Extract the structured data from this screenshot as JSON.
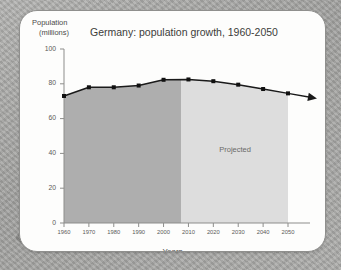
{
  "card": {
    "background_color": "#fdfdfc",
    "border_color": "#8f8f8d"
  },
  "page": {
    "backdrop_color": "#a9a9a7"
  },
  "chart_data": {
    "type": "area",
    "title": "Germany: population growth, 1960-2050",
    "xlabel": "Years",
    "ylabel": "Population (millions)",
    "ylabel_line1": "Population",
    "ylabel_line2": "(millions)",
    "categories": [
      1960,
      1970,
      1980,
      1990,
      2000,
      2010,
      2020,
      2030,
      2040,
      2050
    ],
    "values": [
      73,
      78,
      78,
      79,
      82.3,
      82.5,
      81.5,
      79.5,
      77,
      74.5
    ],
    "series": [
      {
        "name": "Germany population",
        "values": [
          73,
          78,
          78,
          79,
          82.3,
          82.5,
          81.5,
          79.5,
          77,
          74.5
        ]
      }
    ],
    "xlim": [
      1960,
      2050
    ],
    "ylim": [
      0,
      100
    ],
    "yticks": [
      0,
      20,
      40,
      60,
      80,
      100
    ],
    "ytick_labels": [
      "0",
      "20",
      "40",
      "60",
      "80",
      "100"
    ],
    "xticks": [
      1960,
      1970,
      1980,
      1990,
      2000,
      2010,
      2020,
      2030,
      2040,
      2050
    ],
    "xtick_labels": [
      "1960",
      "1970",
      "1980",
      "1990",
      "2000",
      "2010",
      "2020",
      "2030",
      "2040",
      "2050"
    ],
    "grid": false,
    "legend": "none",
    "annotations": [
      {
        "text": "Projected",
        "x": 2030,
        "y": 42
      }
    ],
    "regions": [
      {
        "name": "historical",
        "from": 1960,
        "to": 2007,
        "color": "#aeaeae"
      },
      {
        "name": "projected",
        "from": 2007,
        "to": 2050,
        "color": "#dddddd"
      }
    ],
    "line_color": "#1a1a1a",
    "marker_color": "#111111",
    "arrow_end": true,
    "axis_color": "#8d8d8b"
  }
}
